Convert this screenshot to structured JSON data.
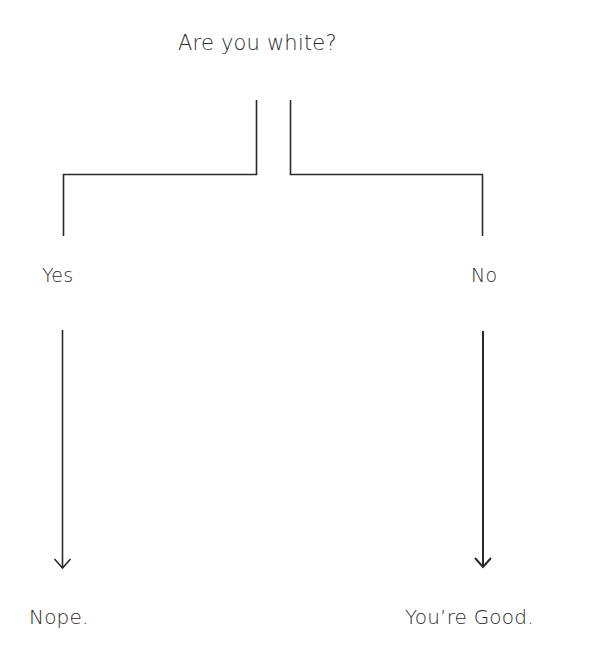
{
  "diagram": {
    "type": "flowchart",
    "question": "Are you white?",
    "branches": [
      {
        "label": "Yes",
        "outcome": "Nope."
      },
      {
        "label": "No",
        "outcome": "You’re Good."
      }
    ],
    "line_color": "#2a2a2a",
    "background": "#ffffff"
  }
}
